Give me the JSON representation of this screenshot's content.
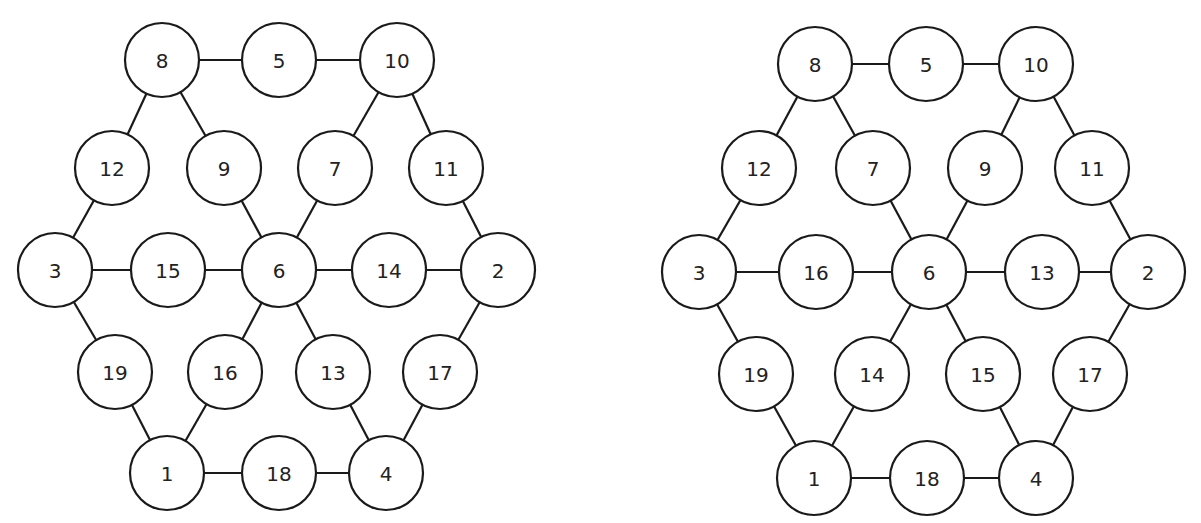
{
  "colors": {
    "stroke": "#1a1a1a",
    "fill": "#ffffff",
    "text": "#222222"
  },
  "node_radius": 37,
  "graphs": [
    {
      "name": "graph-left",
      "nodes": [
        {
          "label": "8",
          "x": 162,
          "y": 60
        },
        {
          "label": "5",
          "x": 279,
          "y": 60
        },
        {
          "label": "10",
          "x": 397,
          "y": 60
        },
        {
          "label": "12",
          "x": 112,
          "y": 168
        },
        {
          "label": "9",
          "x": 224,
          "y": 168
        },
        {
          "label": "7",
          "x": 335,
          "y": 168
        },
        {
          "label": "11",
          "x": 446,
          "y": 168
        },
        {
          "label": "3",
          "x": 55,
          "y": 270
        },
        {
          "label": "15",
          "x": 168,
          "y": 270
        },
        {
          "label": "6",
          "x": 279,
          "y": 270
        },
        {
          "label": "14",
          "x": 389,
          "y": 270
        },
        {
          "label": "2",
          "x": 498,
          "y": 270
        },
        {
          "label": "19",
          "x": 115,
          "y": 372
        },
        {
          "label": "16",
          "x": 225,
          "y": 372
        },
        {
          "label": "13",
          "x": 333,
          "y": 372
        },
        {
          "label": "17",
          "x": 440,
          "y": 372
        },
        {
          "label": "1",
          "x": 167,
          "y": 473
        },
        {
          "label": "18",
          "x": 279,
          "y": 473
        },
        {
          "label": "4",
          "x": 386,
          "y": 473
        }
      ],
      "edges": [
        [
          "8",
          "5"
        ],
        [
          "5",
          "10"
        ],
        [
          "8",
          "12"
        ],
        [
          "8",
          "9"
        ],
        [
          "10",
          "7"
        ],
        [
          "10",
          "11"
        ],
        [
          "12",
          "3"
        ],
        [
          "9",
          "6"
        ],
        [
          "7",
          "6"
        ],
        [
          "11",
          "2"
        ],
        [
          "3",
          "15"
        ],
        [
          "15",
          "6"
        ],
        [
          "6",
          "14"
        ],
        [
          "14",
          "2"
        ],
        [
          "3",
          "19"
        ],
        [
          "6",
          "16"
        ],
        [
          "6",
          "13"
        ],
        [
          "2",
          "17"
        ],
        [
          "19",
          "1"
        ],
        [
          "16",
          "1"
        ],
        [
          "13",
          "4"
        ],
        [
          "17",
          "4"
        ],
        [
          "1",
          "18"
        ],
        [
          "18",
          "4"
        ]
      ]
    },
    {
      "name": "graph-right",
      "nodes": [
        {
          "label": "8",
          "x": 815,
          "y": 64
        },
        {
          "label": "5",
          "x": 926,
          "y": 64
        },
        {
          "label": "10",
          "x": 1036,
          "y": 64
        },
        {
          "label": "12",
          "x": 759,
          "y": 168
        },
        {
          "label": "7",
          "x": 873,
          "y": 168
        },
        {
          "label": "9",
          "x": 985,
          "y": 168
        },
        {
          "label": "11",
          "x": 1092,
          "y": 168
        },
        {
          "label": "3",
          "x": 699,
          "y": 272
        },
        {
          "label": "16",
          "x": 816,
          "y": 272
        },
        {
          "label": "6",
          "x": 929,
          "y": 272
        },
        {
          "label": "13",
          "x": 1042,
          "y": 272
        },
        {
          "label": "2",
          "x": 1148,
          "y": 272
        },
        {
          "label": "19",
          "x": 756,
          "y": 374
        },
        {
          "label": "14",
          "x": 872,
          "y": 374
        },
        {
          "label": "15",
          "x": 983,
          "y": 374
        },
        {
          "label": "17",
          "x": 1090,
          "y": 374
        },
        {
          "label": "1",
          "x": 814,
          "y": 478
        },
        {
          "label": "18",
          "x": 927,
          "y": 478
        },
        {
          "label": "4",
          "x": 1036,
          "y": 478
        }
      ],
      "edges": [
        [
          "8",
          "5"
        ],
        [
          "5",
          "10"
        ],
        [
          "8",
          "12"
        ],
        [
          "8",
          "7"
        ],
        [
          "10",
          "9"
        ],
        [
          "10",
          "11"
        ],
        [
          "12",
          "3"
        ],
        [
          "7",
          "6"
        ],
        [
          "9",
          "6"
        ],
        [
          "11",
          "2"
        ],
        [
          "3",
          "16"
        ],
        [
          "16",
          "6"
        ],
        [
          "6",
          "13"
        ],
        [
          "13",
          "2"
        ],
        [
          "3",
          "19"
        ],
        [
          "6",
          "14"
        ],
        [
          "6",
          "15"
        ],
        [
          "2",
          "17"
        ],
        [
          "19",
          "1"
        ],
        [
          "14",
          "1"
        ],
        [
          "15",
          "4"
        ],
        [
          "17",
          "4"
        ],
        [
          "1",
          "18"
        ],
        [
          "18",
          "4"
        ]
      ]
    }
  ]
}
